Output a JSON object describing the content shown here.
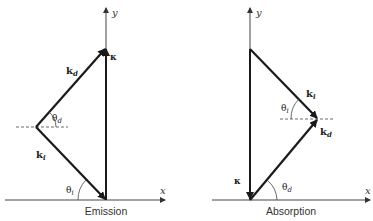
{
  "figure": {
    "panels": [
      {
        "id": "emission",
        "caption": "Emission",
        "axes": {
          "x_label": "x",
          "y_label": "y"
        },
        "vectors": [
          {
            "name": "k",
            "subscript": "i",
            "label": "k_i"
          },
          {
            "name": "k",
            "subscript": "d",
            "label": "k_d"
          },
          {
            "name": "κ",
            "label": "κ"
          }
        ],
        "angles": [
          {
            "symbol": "θ",
            "subscript": "d",
            "label": "θ_d"
          },
          {
            "symbol": "θ",
            "subscript": "i",
            "label": "θ_i"
          }
        ]
      },
      {
        "id": "absorption",
        "caption": "Absorption",
        "axes": {
          "x_label": "x",
          "y_label": "y"
        },
        "vectors": [
          {
            "name": "k",
            "subscript": "i",
            "label": "k_i"
          },
          {
            "name": "k",
            "subscript": "d",
            "label": "k_d"
          },
          {
            "name": "κ",
            "label": "κ"
          }
        ],
        "angles": [
          {
            "symbol": "θ",
            "subscript": "i",
            "label": "θ_i"
          },
          {
            "symbol": "θ",
            "subscript": "d",
            "label": "θ_d"
          }
        ]
      }
    ]
  }
}
